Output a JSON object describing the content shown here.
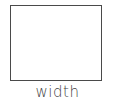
{
  "diagram": {
    "shape": {
      "type": "rectangle",
      "stroke_color": "#4a4a4a",
      "fill_color": "#ffffff"
    },
    "label": "width",
    "label_color": "#3f3f3f"
  }
}
